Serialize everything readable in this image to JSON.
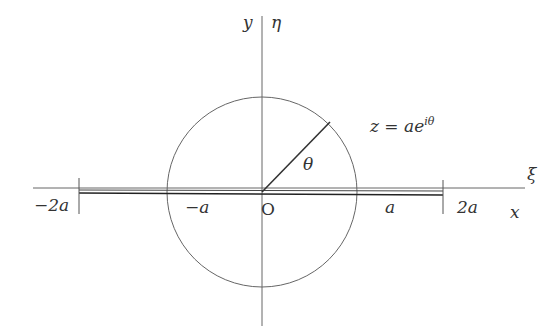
{
  "diagram": {
    "colors": {
      "stroke": "#555555",
      "slit": "#333333",
      "text": "#333333",
      "background": "#ffffff"
    },
    "axes": {
      "x_label": "x",
      "y_label": "y",
      "xi_label": "ξ",
      "eta_label": "η",
      "origin_label": "O"
    },
    "ticks": {
      "minus_2a": "−2a",
      "minus_a": "−a",
      "a": "a",
      "two_a": "2a"
    },
    "circle_equation": {
      "base": "z = ae",
      "exponent": "iθ"
    },
    "angle_label": "θ"
  }
}
